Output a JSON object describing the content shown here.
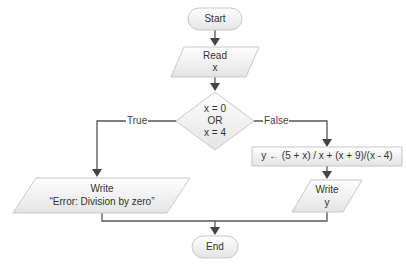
{
  "flowchart": {
    "nodes": {
      "start": {
        "type": "terminator",
        "label": "Start"
      },
      "read": {
        "type": "input-output",
        "line1": "Read",
        "line2": "x"
      },
      "decision": {
        "type": "decision",
        "line1": "x = 0",
        "line2": "OR",
        "line3": "x = 4"
      },
      "compute": {
        "type": "process",
        "label": "y ←  (5 + x) / x + (x + 9)/(x - 4)"
      },
      "write_error": {
        "type": "input-output",
        "line1": "Write",
        "line2": "“Error: Division by zero”"
      },
      "write_y": {
        "type": "input-output",
        "line1": "Write",
        "line2": "y"
      },
      "end": {
        "type": "terminator",
        "label": "End"
      }
    },
    "edges": {
      "true_label": "True",
      "false_label": "False"
    },
    "colors": {
      "shape_fill_top": "#ffffff",
      "shape_fill_bottom": "#e6e6e6",
      "shape_stroke": "#c8c8c8",
      "connector": "#555555"
    }
  }
}
